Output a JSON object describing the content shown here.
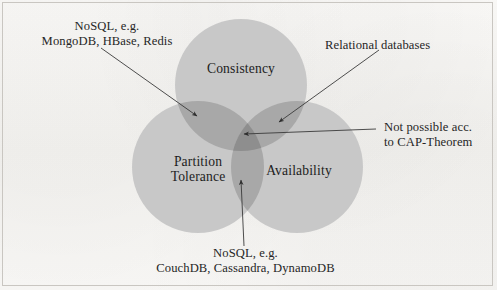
{
  "figure": {
    "type": "venn-diagram",
    "subject": "CAP-Theorem",
    "background_color": "#f7f6f4",
    "border_color": "#c9c6c1",
    "text_color": "#242424"
  },
  "chart_data": {
    "type": "venn",
    "title": "",
    "sets": [
      {
        "id": "consistency",
        "label": "Consistency",
        "cx": 241,
        "cy": 85,
        "r": 66,
        "fill": "#c8c8c8"
      },
      {
        "id": "partition-tolerance",
        "label": "Partition\nTolerance",
        "label_line1": "Partition",
        "label_line2": "Tolerance",
        "cx": 198,
        "cy": 167,
        "r": 66,
        "fill": "#c8c8c8"
      },
      {
        "id": "availability",
        "label": "Availability",
        "cx": 297,
        "cy": 167,
        "r": 66,
        "fill": "#c8c8c8"
      }
    ],
    "regions": [
      {
        "id": "consistency-partition",
        "sets": [
          "Consistency",
          "Partition Tolerance"
        ],
        "label": "NoSQL, e.g. MongoDB, HBase, Redis",
        "fill": "#a8a8a8"
      },
      {
        "id": "consistency-availability",
        "sets": [
          "Consistency",
          "Availability"
        ],
        "label": "Relational databases",
        "fill": "#a8a8a8"
      },
      {
        "id": "partition-availability",
        "sets": [
          "Partition Tolerance",
          "Availability"
        ],
        "label": "NoSQL, e.g. CouchDB, Cassandra, DynamoDB",
        "fill": "#a8a8a8"
      },
      {
        "id": "all-three",
        "sets": [
          "Consistency",
          "Partition Tolerance",
          "Availability"
        ],
        "label": "Not possible acc. to CAP-Theorem",
        "fill": "#8e8e8e"
      }
    ],
    "colors": {
      "single_overlap": "#c8c8c8",
      "double_overlap": "#a8a8a8",
      "triple_overlap": "#8e8e8e",
      "leader_line": "#3a3a3a"
    }
  },
  "circle_labels": {
    "consistency": "Consistency",
    "partition_tolerance_line1": "Partition",
    "partition_tolerance_line2": "Tolerance",
    "availability": "Availability"
  },
  "annotations": {
    "top_left": {
      "line1": "NoSQL, e.g.",
      "line2": "MongoDB, HBase, Redis"
    },
    "top_right": {
      "line1": "Relational databases"
    },
    "right": {
      "line1": "Not possible acc.",
      "line2": "to CAP-Theorem"
    },
    "bottom": {
      "line1": "NoSQL, e.g.",
      "line2": "CouchDB, Cassandra, DynamoDB"
    }
  }
}
